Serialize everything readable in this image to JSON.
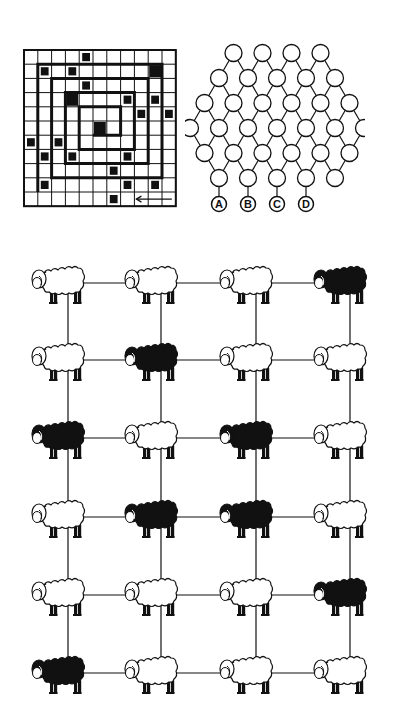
{
  "spiral_grid": {
    "rows": 11,
    "cols": 11,
    "black_cells": [
      [
        0,
        4
      ],
      [
        1,
        1
      ],
      [
        1,
        3
      ],
      [
        1,
        9
      ],
      [
        2,
        4
      ],
      [
        3,
        3
      ],
      [
        3,
        7
      ],
      [
        3,
        9
      ],
      [
        4,
        8
      ],
      [
        4,
        10
      ],
      [
        5,
        5
      ],
      [
        6,
        0
      ],
      [
        6,
        2
      ],
      [
        7,
        1
      ],
      [
        7,
        3
      ],
      [
        7,
        7
      ],
      [
        8,
        6
      ],
      [
        9,
        1
      ],
      [
        9,
        7
      ],
      [
        9,
        9
      ],
      [
        10,
        6
      ]
    ],
    "large_cells": [
      [
        1,
        9
      ],
      [
        3,
        3
      ],
      [
        5,
        5
      ]
    ],
    "arrow": "left-arrow"
  },
  "hex_circles": {
    "row_counts": [
      4,
      5,
      6,
      7,
      6,
      5
    ],
    "labels": [
      "A",
      "B",
      "C",
      "D"
    ]
  },
  "sheep_grid": {
    "rows": [
      [
        "white",
        "white",
        "white",
        "black"
      ],
      [
        "white",
        "black",
        "white",
        "white"
      ],
      [
        "black",
        "white",
        "black",
        "white"
      ],
      [
        "white",
        "black",
        "black",
        "white"
      ],
      [
        "white",
        "white",
        "white",
        "black"
      ],
      [
        "black",
        "white",
        "white",
        "white"
      ]
    ]
  },
  "colors": {
    "ink": "#111111",
    "paper": "#ffffff"
  }
}
